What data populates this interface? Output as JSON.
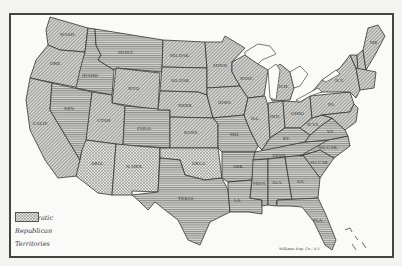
{
  "map": {
    "subject": "United States presidential election map by party",
    "credit": "Williams Eng. Co., N.Y.",
    "colors": {
      "border": "#333333",
      "land_fill": "#c9c9c6",
      "water": "#fafaf8",
      "hatch": "#555555"
    }
  },
  "legend": {
    "items": [
      {
        "label": "Democratic",
        "pattern": "horizontal-lines"
      },
      {
        "label": "Republican",
        "pattern": "diagonal-hatch"
      },
      {
        "label": "Territories",
        "pattern": "cross-hatch"
      }
    ]
  },
  "states": {
    "wash": {
      "label": "WASH.",
      "party": "Republican"
    },
    "ore": {
      "label": "ORE.",
      "party": "Republican"
    },
    "calif": {
      "label": "CALIF.",
      "party": "Republican"
    },
    "idaho": {
      "label": "IDAHO",
      "party": "Democratic"
    },
    "nev": {
      "label": "NEV.",
      "party": "Democratic"
    },
    "mont": {
      "label": "MONT.",
      "party": "Democratic"
    },
    "wyo": {
      "label": "WYO.",
      "party": "Republican"
    },
    "utah": {
      "label": "UTAH",
      "party": "Republican"
    },
    "colo": {
      "label": "COLO.",
      "party": "Democratic"
    },
    "ariz": {
      "label": "ARIZ.",
      "party": "Territory"
    },
    "nmex": {
      "label": "N.MEX.",
      "party": "Territory"
    },
    "okla": {
      "label": "OKLA.",
      "party": "Territory"
    },
    "nodak": {
      "label": "NO.DAK.",
      "party": "Republican"
    },
    "sodak": {
      "label": "SO.DAK.",
      "party": "Republican"
    },
    "nebr": {
      "label": "NEBR.",
      "party": "Republican"
    },
    "kans": {
      "label": "KANS.",
      "party": "Republican"
    },
    "texas": {
      "label": "TEXAS",
      "party": "Democratic"
    },
    "minn": {
      "label": "MINN.",
      "party": "Republican"
    },
    "iowa": {
      "label": "IOWA",
      "party": "Republican"
    },
    "mo": {
      "label": "MO.",
      "party": "Democratic"
    },
    "ark": {
      "label": "ARK.",
      "party": "Democratic"
    },
    "la": {
      "label": "LA.",
      "party": "Democratic"
    },
    "wisc": {
      "label": "WISC.",
      "party": "Republican"
    },
    "ill": {
      "label": "ILL.",
      "party": "Republican"
    },
    "mich": {
      "label": "MICH.",
      "party": "Republican"
    },
    "ind": {
      "label": "IND.",
      "party": "Republican"
    },
    "ohio": {
      "label": "OHIO",
      "party": "Republican"
    },
    "ky": {
      "label": "KY.",
      "party": "Democratic"
    },
    "tenn": {
      "label": "TENN.",
      "party": "Democratic"
    },
    "miss": {
      "label": "MISS.",
      "party": "Democratic"
    },
    "ala": {
      "label": "ALA.",
      "party": "Democratic"
    },
    "ga": {
      "label": "GA.",
      "party": "Democratic"
    },
    "fla": {
      "label": "FLA.",
      "party": "Democratic"
    },
    "sc": {
      "label": "SO.CAR.",
      "party": "Democratic"
    },
    "nc": {
      "label": "NO.CAR.",
      "party": "Democratic"
    },
    "va": {
      "label": "VA.",
      "party": "Democratic"
    },
    "wva": {
      "label": "W.VA.",
      "party": "Republican"
    },
    "pa": {
      "label": "PA.",
      "party": "Republican"
    },
    "ny": {
      "label": "N.Y.",
      "party": "Republican"
    },
    "me": {
      "label": "ME.",
      "party": "Republican"
    },
    "vt": {
      "label": "VT.",
      "party": "Republican"
    },
    "nh": {
      "label": "N.H.",
      "party": "Republican"
    }
  }
}
